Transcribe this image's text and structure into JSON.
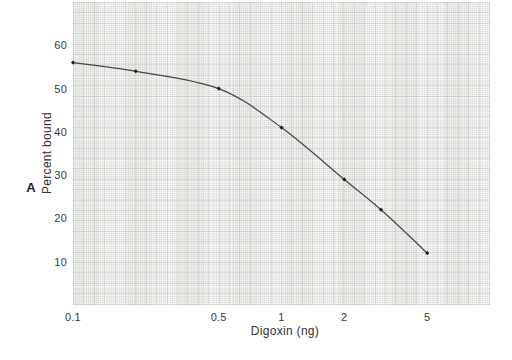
{
  "figure": {
    "panel_label": "A"
  },
  "chart_data": {
    "type": "line",
    "title": "",
    "xlabel": "Digoxin (ng)",
    "ylabel": "Percent bound",
    "x_scale": "log",
    "y_scale": "linear",
    "xlim": [
      0.1,
      10
    ],
    "ylim": [
      0,
      70
    ],
    "grid": "fine graph paper, on",
    "legend_position": "none",
    "x_ticks": [
      {
        "value": 0.1,
        "label": "0.1"
      },
      {
        "value": 0.5,
        "label": "0.5"
      },
      {
        "value": 1,
        "label": "1"
      },
      {
        "value": 2,
        "label": "2"
      },
      {
        "value": 5,
        "label": "5"
      }
    ],
    "y_ticks": [
      {
        "value": 10,
        "label": "10"
      },
      {
        "value": 20,
        "label": "20"
      },
      {
        "value": 30,
        "label": "30"
      },
      {
        "value": 40,
        "label": "40"
      },
      {
        "value": 50,
        "label": "50"
      },
      {
        "value": 60,
        "label": "60"
      }
    ],
    "series": [
      {
        "name": "digoxin standard curve",
        "marker": "diamond",
        "x": [
          0.1,
          0.2,
          0.5,
          1,
          2,
          3,
          5
        ],
        "y": [
          56,
          54,
          50,
          41,
          29,
          22,
          12
        ]
      }
    ],
    "colors": {
      "curve": "#454545",
      "marker": "#1c1c1c",
      "tick_text": "#3a3a3a",
      "paper_grid": "#e9ebe8",
      "page_background": "#ffffff"
    }
  }
}
